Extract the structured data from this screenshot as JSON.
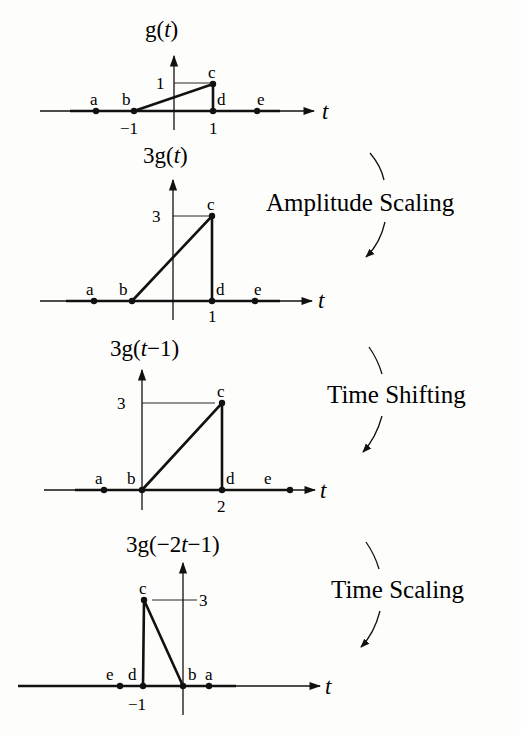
{
  "panels": [
    {
      "title": "g(t)",
      "title_parts": {
        "pre": "g(",
        "var": "t",
        "post": ")"
      },
      "axis_label": "t",
      "y_tick": "1",
      "x_ticks": [
        "−1",
        "1"
      ],
      "points": {
        "a": "a",
        "b": "b",
        "c": "c",
        "d": "d",
        "e": "e"
      }
    },
    {
      "title": "3g(t)",
      "title_parts": {
        "pre": "3g(",
        "var": "t",
        "post": ")"
      },
      "axis_label": "t",
      "y_tick": "3",
      "x_ticks": [
        "1"
      ],
      "points": {
        "a": "a",
        "b": "b",
        "c": "c",
        "d": "d",
        "e": "e"
      }
    },
    {
      "title": "3g(t−1)",
      "title_parts": {
        "pre": "3g(",
        "var": "t",
        "post": "−1)"
      },
      "axis_label": "t",
      "y_tick": "3",
      "x_ticks": [
        "2"
      ],
      "points": {
        "a": "a",
        "b": "b",
        "c": "c",
        "d": "d",
        "e": "e"
      }
    },
    {
      "title": "3g(−2t−1)",
      "title_parts": {
        "pre": "3g(−2",
        "var": "t",
        "post": "−1)"
      },
      "axis_label": "t",
      "y_tick": "3",
      "x_ticks": [
        "−1"
      ],
      "points": {
        "a": "a",
        "b": "b",
        "c": "c",
        "d": "d",
        "e": "e"
      }
    }
  ],
  "operations": [
    {
      "label": "Amplitude Scaling"
    },
    {
      "label": "Time Shifting"
    },
    {
      "label": "Time Scaling"
    }
  ],
  "colors": {
    "ink": "#111111",
    "background": "#fdfdfb"
  }
}
